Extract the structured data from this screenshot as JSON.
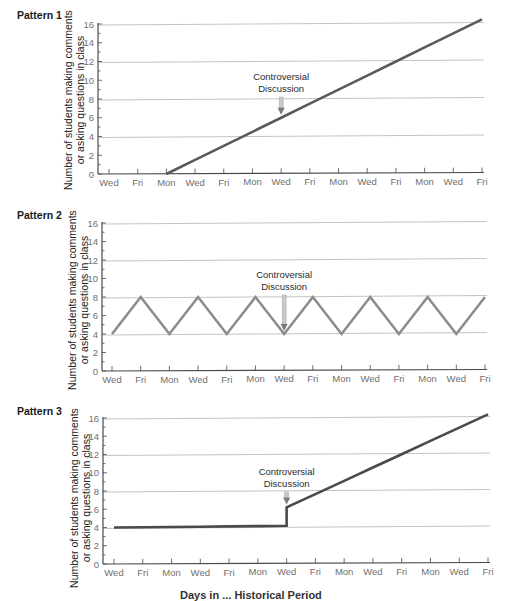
{
  "chart_data": [
    {
      "type": "line",
      "title": "Pattern 1",
      "xlabel": "",
      "ylabel": "Number of students making comments or asking questions in class",
      "ylim": [
        0,
        16
      ],
      "yticks": [
        0,
        2,
        4,
        6,
        8,
        10,
        12,
        14,
        16
      ],
      "gridlines_at": [
        4,
        8,
        12,
        16
      ],
      "categories": [
        "Wed",
        "Fri",
        "Mon",
        "Wed",
        "Fri",
        "Mon",
        "Wed",
        "Fri",
        "Mon",
        "Wed",
        "Fri",
        "Mon",
        "Wed",
        "Fri"
      ],
      "series": [
        {
          "name": "Pattern 1",
          "values": [
            null,
            null,
            0,
            1.5,
            3,
            4.5,
            6,
            7.5,
            9,
            10.5,
            12,
            13.5,
            15,
            16.5
          ],
          "color": "#5a5a5a"
        }
      ],
      "annotation": {
        "text_line1": "Controversial",
        "text_line2": "Discussion",
        "at_index": 6
      }
    },
    {
      "type": "line",
      "title": "Pattern 2",
      "xlabel": "",
      "ylabel": "Number of students making comments or asking questions in class",
      "ylim": [
        0,
        16
      ],
      "yticks": [
        0,
        2,
        4,
        6,
        8,
        10,
        12,
        14,
        16
      ],
      "gridlines_at": [
        4,
        8,
        12,
        16
      ],
      "categories": [
        "Wed",
        "Fri",
        "Mon",
        "Wed",
        "Fri",
        "Mon",
        "Wed",
        "Fri",
        "Mon",
        "Wed",
        "Fri",
        "Mon",
        "Wed",
        "Fri"
      ],
      "series": [
        {
          "name": "Pattern 2",
          "values": [
            4,
            8,
            4,
            8,
            4,
            8,
            4,
            8,
            4,
            8,
            4,
            8,
            4,
            8
          ],
          "color": "#8c8c8c"
        }
      ],
      "annotation": {
        "text_line1": "Controversial",
        "text_line2": "Discussion",
        "at_index": 6
      }
    },
    {
      "type": "line",
      "title": "Pattern 3",
      "xlabel": "",
      "ylabel": "Number of students making comments or asking questions in class",
      "ylim": [
        0,
        16
      ],
      "yticks": [
        0,
        2,
        4,
        6,
        8,
        10,
        12,
        14,
        16
      ],
      "gridlines_at": [
        4,
        8,
        12,
        16
      ],
      "categories": [
        "Wed",
        "Fri",
        "Mon",
        "Wed",
        "Fri",
        "Mon",
        "Wed",
        "Fri",
        "Mon",
        "Wed",
        "Fri",
        "Mon",
        "Wed",
        "Fri"
      ],
      "series": [
        {
          "name": "Pattern 3",
          "values": [
            4,
            4.03,
            4.06,
            4.09,
            4.12,
            4.15,
            4.2,
            7.6,
            9.1,
            10.5,
            12.0,
            13.5,
            15.0,
            16.4
          ],
          "jump_at_index": 6,
          "jump_to": 6.2,
          "color": "#4a4a4a"
        }
      ],
      "annotation": {
        "text_line1": "Controversial",
        "text_line2": "Discussion",
        "at_index": 6
      }
    }
  ],
  "panels": [
    {
      "title": "Pattern 1",
      "ylabel_line1": "Number of students making comments",
      "ylabel_line2": "or asking questions in class",
      "annotation_line1": "Controversial",
      "annotation_line2": "Discussion"
    },
    {
      "title": "Pattern 2",
      "ylabel_line1": "Number of students making comments",
      "ylabel_line2": "or asking questions in class",
      "annotation_line1": "Controversial",
      "annotation_line2": "Discussion"
    },
    {
      "title": "Pattern 3",
      "ylabel_line1": "Number of students making comments",
      "ylabel_line2": "or asking questions in class",
      "annotation_line1": "Controversial",
      "annotation_line2": "Discussion"
    }
  ],
  "caption_partial": "Days in ... Historical Period",
  "colors": {
    "gridline": "#c4c4c4",
    "axis": "#4a4a4a",
    "tick_label": "#6f6f6f",
    "arrow_shaft": "#c8c8c8",
    "arrow_head": "#7a7a7a"
  }
}
